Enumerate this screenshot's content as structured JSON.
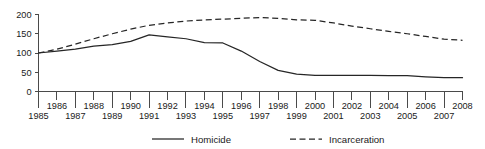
{
  "chart_data": {
    "type": "line",
    "title": "",
    "xlabel": "",
    "ylabel": "",
    "xlim": [
      1985,
      2008
    ],
    "ylim": [
      0,
      200
    ],
    "grid": false,
    "legend_position": "bottom",
    "y_ticks": [
      0,
      50,
      100,
      150,
      200
    ],
    "y_tick_labels": [
      "0",
      "50",
      "100",
      "150",
      "200"
    ],
    "x": [
      1985,
      1986,
      1987,
      1988,
      1989,
      1990,
      1991,
      1992,
      1993,
      1994,
      1995,
      1996,
      1997,
      1998,
      1999,
      2000,
      2001,
      2002,
      2003,
      2004,
      2005,
      2006,
      2007,
      2008
    ],
    "x_tick_labels": [
      "1985",
      "1986",
      "1987",
      "1988",
      "1989",
      "1990",
      "1991",
      "1992",
      "1993",
      "1994",
      "1995",
      "1996",
      "1997",
      "1998",
      "1999",
      "2000",
      "2001",
      "2002",
      "2003",
      "2004",
      "2005",
      "2006",
      "2007",
      "2008"
    ],
    "series": [
      {
        "name": "Homicide",
        "style": "solid",
        "color": "#262626",
        "values": [
          100,
          105,
          110,
          118,
          122,
          130,
          147,
          142,
          137,
          127,
          126,
          105,
          78,
          55,
          45,
          42,
          42,
          42,
          42,
          41,
          41,
          38,
          36,
          36
        ]
      },
      {
        "name": "Incarceration",
        "style": "dashed",
        "color": "#262626",
        "values": [
          100,
          110,
          123,
          137,
          150,
          162,
          172,
          178,
          183,
          186,
          188,
          190,
          192,
          190,
          186,
          185,
          178,
          170,
          163,
          156,
          150,
          143,
          136,
          133
        ]
      }
    ]
  },
  "legend": {
    "items": [
      {
        "label": "Homicide",
        "style": "solid"
      },
      {
        "label": "Incarceration",
        "style": "dashed"
      }
    ]
  }
}
